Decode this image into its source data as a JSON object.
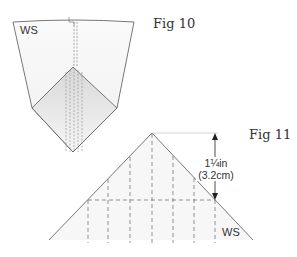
{
  "figures": [
    {
      "id": "fig10",
      "label": "Fig 10",
      "side_label": "WS"
    },
    {
      "id": "fig11",
      "label": "Fig 11",
      "side_label": "WS",
      "measurement": {
        "imperial": "1¼in",
        "metric": "(3.2cm)"
      }
    }
  ],
  "colors": {
    "line": "#555555",
    "dash": "#666666",
    "shade": "#ececec",
    "text": "#333333"
  }
}
